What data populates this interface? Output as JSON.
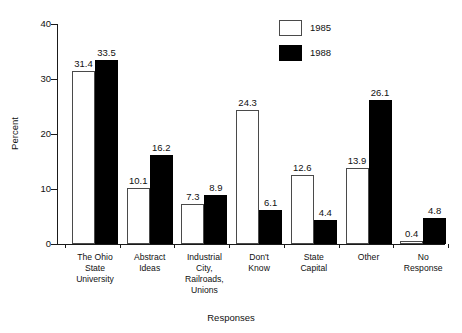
{
  "chart_data": {
    "type": "bar",
    "title": "",
    "xlabel": "Responses",
    "ylabel": "Percent",
    "ylim": [
      0,
      40
    ],
    "yticks": [
      0,
      10,
      20,
      30,
      40
    ],
    "grid": false,
    "legend_position": "top-right",
    "categories": [
      "The Ohio\nState\nUniversity",
      "Abstract\nIdeas",
      "Industrial\nCity,\nRailroads,\nUnions",
      "Don't\nKnow",
      "State\nCapital",
      "Other",
      "No\nResponse"
    ],
    "category_lines": [
      [
        "The Ohio",
        "State",
        "University"
      ],
      [
        "Abstract",
        "Ideas"
      ],
      [
        "Industrial",
        "City,",
        "Railroads,",
        "Unions"
      ],
      [
        "Don't",
        "Know"
      ],
      [
        "State",
        "Capital"
      ],
      [
        "Other"
      ],
      [
        "No",
        "Response"
      ]
    ],
    "series": [
      {
        "name": "1985",
        "color": "#ffffff",
        "values": [
          31.4,
          10.1,
          7.3,
          24.3,
          12.6,
          13.9,
          0.4
        ],
        "labels": [
          "31.4",
          "10.1",
          "7.3",
          "24.3",
          "12.6",
          "13.9",
          "0.4"
        ]
      },
      {
        "name": "1988",
        "color": "#000000",
        "values": [
          33.5,
          16.2,
          8.9,
          6.1,
          4.4,
          26.1,
          4.8
        ],
        "labels": [
          "33.5",
          "16.2",
          "8.9",
          "6.1",
          "4.4",
          "26.1",
          "4.8"
        ]
      }
    ],
    "ytick_labels": [
      "0",
      "10",
      "20",
      "30",
      "40"
    ]
  },
  "legend": {
    "items": [
      {
        "label": "1985",
        "swatch": "white-square-icon"
      },
      {
        "label": "1988",
        "swatch": "black-square-icon"
      }
    ]
  }
}
